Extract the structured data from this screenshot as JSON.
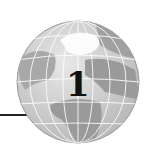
{
  "chapter": {
    "number": "1",
    "icon": "globe-icon"
  },
  "colors": {
    "ocean": "#d8d8d8",
    "land": "#9a9a9a",
    "grid": "#ffffff",
    "rule": "#222222",
    "number": "#111111"
  }
}
